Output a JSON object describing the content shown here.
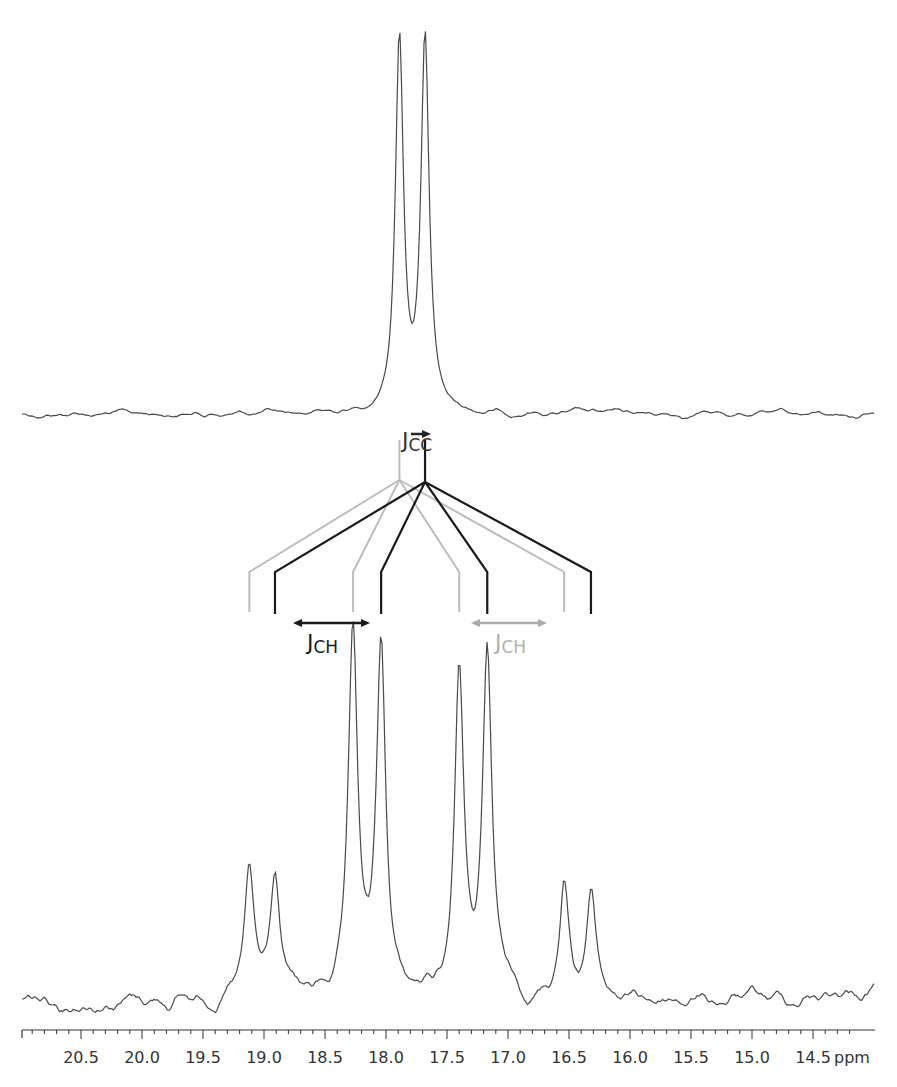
{
  "chart_data": {
    "type": "line",
    "title": "",
    "xlabel": "ppm",
    "ylabel": "",
    "xlim": [
      21.0,
      14.2
    ],
    "x_reversed": true,
    "grid": false,
    "legend": null,
    "tick_labels": [
      "20.5",
      "20.0",
      "19.5",
      "19.0",
      "18.5",
      "18.0",
      "17.5",
      "17.0",
      "16.5",
      "16.0",
      "15.5",
      "15.0",
      "14.5"
    ],
    "tick_values": [
      20.5,
      20.0,
      19.5,
      19.0,
      18.5,
      18.0,
      17.5,
      17.0,
      16.5,
      16.0,
      15.5,
      15.0,
      14.5
    ],
    "minor_tick_step": 0.1,
    "axis_unit_label": "ppm",
    "series": [
      {
        "name": "Top spectrum (1H-decoupled, doublet from J_CC)",
        "panel": "top",
        "peaks": [
          {
            "ppm": 17.89,
            "relative_height": 1.0
          },
          {
            "ppm": 17.68,
            "relative_height": 0.99
          }
        ],
        "linewidth_ppm": 0.04,
        "noise": "low"
      },
      {
        "name": "Bottom spectrum (1H-coupled, J_CH quartet split by J_CC)",
        "panel": "bottom",
        "peaks": [
          {
            "ppm": 19.12,
            "relative_height": 0.34
          },
          {
            "ppm": 18.91,
            "relative_height": 0.34
          },
          {
            "ppm": 18.27,
            "relative_height": 1.0
          },
          {
            "ppm": 18.04,
            "relative_height": 0.97
          },
          {
            "ppm": 17.4,
            "relative_height": 0.94
          },
          {
            "ppm": 17.17,
            "relative_height": 0.94
          },
          {
            "ppm": 16.54,
            "relative_height": 0.34
          },
          {
            "ppm": 16.32,
            "relative_height": 0.3
          }
        ],
        "linewidth_ppm": 0.045,
        "noise": "moderate"
      }
    ],
    "annotations": [
      {
        "text": "J",
        "subscript": "CC",
        "position": "above splitting tree",
        "color": "#333333",
        "arrow": "right, short"
      },
      {
        "text": "J",
        "subscript": "CH",
        "position": "left, below tree",
        "color": "#1a1a1a",
        "arrow": "double-headed"
      },
      {
        "text": "J",
        "subscript": "CH",
        "position": "right, below tree",
        "color": "#aaaaaa",
        "arrow": "double-headed"
      }
    ],
    "splitting_tree": {
      "gray_branch": {
        "origin_ppm": 17.89,
        "leg_ppm": [
          19.12,
          18.27,
          17.4,
          16.54
        ],
        "color": "#bbbbbb"
      },
      "black_branch": {
        "origin_ppm": 17.68,
        "leg_ppm": [
          18.91,
          18.04,
          17.17,
          16.32
        ],
        "color": "#1a1a1a"
      }
    }
  },
  "labels": {
    "jcc_main": "J",
    "jcc_sub": "CC",
    "jch_left_main": "J",
    "jch_left_sub": "CH",
    "jch_right_main": "J",
    "jch_right_sub": "CH",
    "axis_unit": "ppm"
  },
  "colors": {
    "trace": "#4a4a4a",
    "tree_dark": "#1a1a1a",
    "tree_light": "#bdbdbd",
    "axis": "#333333"
  }
}
